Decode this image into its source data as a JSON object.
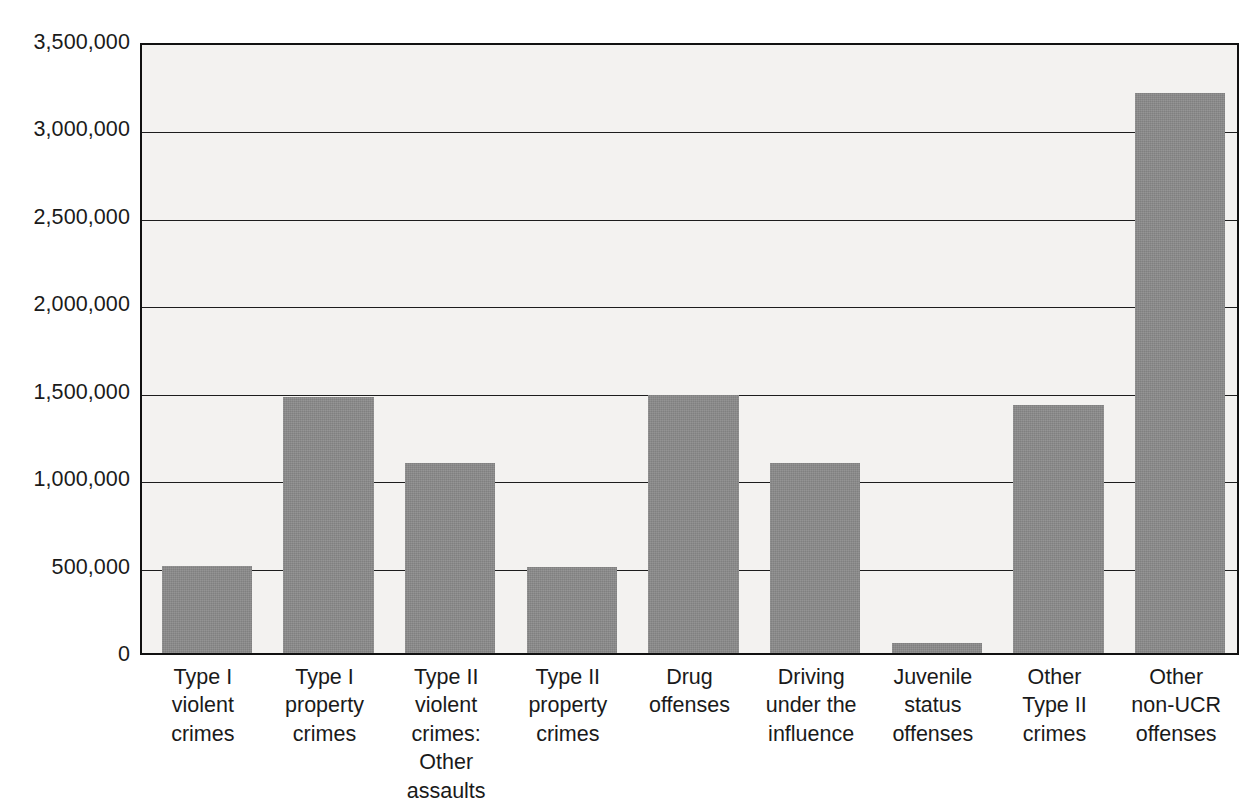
{
  "chart_data": {
    "type": "bar",
    "title": "",
    "subtitle": "",
    "xlabel": "",
    "ylabel": "",
    "ylim": [
      0,
      3500000
    ],
    "ytick_step": 500000,
    "grid": true,
    "legend": false,
    "bar_color": "#8b8b8b",
    "plot_background": "#f3f2f0",
    "axis_color": "#111111",
    "categories": [
      "Type I\nviolent\ncrimes",
      "Type I\nproperty\ncrimes",
      "Type II\nviolent\ncrimes:\nOther\nassaults",
      "Type II\nproperty\ncrimes",
      "Drug\noffenses",
      "Driving\nunder the\ninfluence",
      "Juvenile\nstatus\noffenses",
      "Other\nType II\ncrimes",
      "Other\nnon-UCR\noffenses"
    ],
    "values": [
      500000,
      1465000,
      1085000,
      490000,
      1475000,
      1085000,
      55000,
      1420000,
      3205000
    ],
    "ytick_labels": [
      "3,500,000",
      "3,000,000",
      "2,500,000",
      "2,000,000",
      "1,500,000",
      "1,000,000",
      "500,000",
      "0"
    ],
    "ytick_values": [
      3500000,
      3000000,
      2500000,
      2000000,
      1500000,
      1000000,
      500000,
      0
    ]
  }
}
